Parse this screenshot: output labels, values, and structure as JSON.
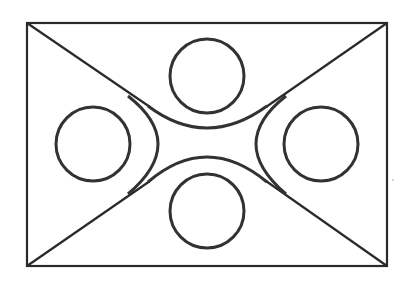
{
  "figure": {
    "type": "geometric-line-diagram",
    "stroke_color": "#2a2a2a",
    "background": "#ffffff",
    "rectangle": {
      "x1": 27,
      "y1": 23,
      "x2": 387,
      "y2": 266
    },
    "diagonals": [
      {
        "name": "top-left-diagonal",
        "from": [
          27,
          23
        ],
        "to": [
          150,
          107
        ]
      },
      {
        "name": "top-right-diagonal",
        "from": [
          387,
          23
        ],
        "to": [
          266,
          107
        ]
      },
      {
        "name": "bottom-left-diagonal",
        "from": [
          27,
          266
        ],
        "to": [
          150,
          181
        ]
      },
      {
        "name": "bottom-right-diagonal",
        "from": [
          387,
          266
        ],
        "to": [
          266,
          181
        ]
      }
    ],
    "circles": [
      {
        "name": "top-circle",
        "cx": 207,
        "cy": 76,
        "r": 37
      },
      {
        "name": "left-circle",
        "cx": 93,
        "cy": 144,
        "r": 37
      },
      {
        "name": "right-circle",
        "cx": 321,
        "cy": 144,
        "r": 37
      },
      {
        "name": "bottom-circle",
        "cx": 207,
        "cy": 211,
        "r": 37
      }
    ],
    "arcs": [
      {
        "name": "top-concave-arc",
        "from": [
          148,
          106
        ],
        "peak": [
          207,
          128
        ],
        "to": [
          267,
          106
        ]
      },
      {
        "name": "bottom-concave-arc",
        "from": [
          148,
          182
        ],
        "peak": [
          207,
          157
        ],
        "to": [
          267,
          182
        ]
      },
      {
        "name": "left-convex-arc",
        "from": [
          128,
          96
        ],
        "peak": [
          158,
          144
        ],
        "to": [
          128,
          194
        ]
      },
      {
        "name": "right-convex-arc",
        "from": [
          286,
          96
        ],
        "peak": [
          256,
          144
        ],
        "to": [
          286,
          194
        ]
      }
    ]
  }
}
